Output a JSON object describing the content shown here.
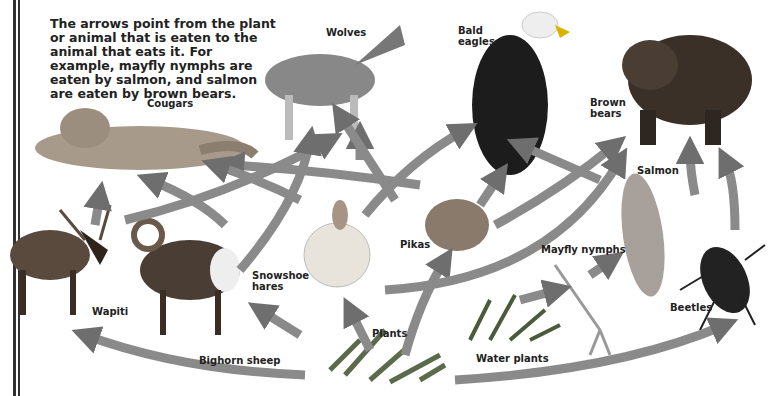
{
  "caption": "The arrows point from the plant or animal that is eaten to the animal that eats it. For example, mayfly nymphs are eaten by salmon, and salmon are eaten by brown bears.",
  "organisms": {
    "wolves": "Wolves",
    "bald_eagles_1": "Bald",
    "bald_eagles_2": "eagles",
    "cougars": "Cougars",
    "brown_bears_1": "Brown",
    "brown_bears_2": "bears",
    "salmon": "Salmon",
    "pikas": "Pikas",
    "snowshoe_hares_1": "Snowshoe",
    "snowshoe_hares_2": "hares",
    "mayfly_nymphs": "Mayfly nymphs",
    "wapiti": "Wapiti",
    "plants": "Plants",
    "beetles": "Beetles",
    "bighorn_sheep": "Bighorn sheep",
    "water_plants": "Water plants"
  },
  "colors": {
    "arrow": "#8a8a8a",
    "arrow_light": "#d8d8d8",
    "text": "#222222"
  },
  "food_web": [
    {
      "from": "Plants",
      "to": "Snowshoe hares"
    },
    {
      "from": "Plants",
      "to": "Pikas"
    },
    {
      "from": "Plants",
      "to": "Bighorn sheep"
    },
    {
      "from": "Plants",
      "to": "Wapiti"
    },
    {
      "from": "Plants",
      "to": "Beetles"
    },
    {
      "from": "Water plants",
      "to": "Mayfly nymphs"
    },
    {
      "from": "Mayfly nymphs",
      "to": "Salmon"
    },
    {
      "from": "Salmon",
      "to": "Brown bears"
    },
    {
      "from": "Beetles",
      "to": "Brown bears"
    },
    {
      "from": "Wapiti",
      "to": "Cougars"
    },
    {
      "from": "Wapiti",
      "to": "Wolves"
    },
    {
      "from": "Bighorn sheep",
      "to": "Cougars"
    },
    {
      "from": "Bighorn sheep",
      "to": "Wolves"
    },
    {
      "from": "Snowshoe hares",
      "to": "Wolves"
    },
    {
      "from": "Snowshoe hares",
      "to": "Cougars"
    },
    {
      "from": "Snowshoe hares",
      "to": "Bald eagles"
    },
    {
      "from": "Pikas",
      "to": "Bald eagles"
    },
    {
      "from": "Pikas",
      "to": "Wolves"
    },
    {
      "from": "Pikas",
      "to": "Cougars"
    },
    {
      "from": "Pikas",
      "to": "Brown bears"
    }
  ]
}
